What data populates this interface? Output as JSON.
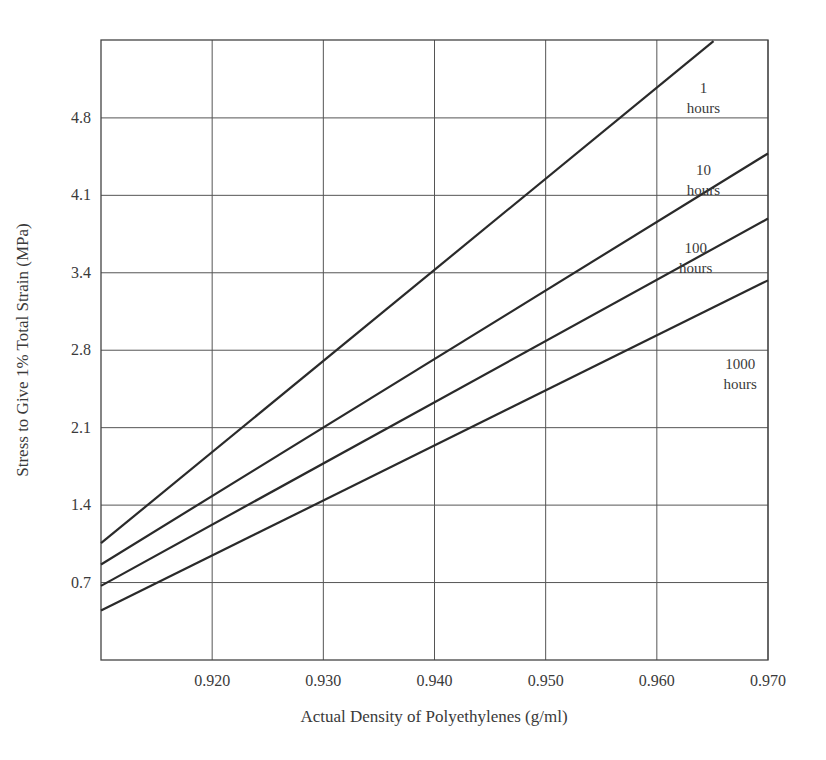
{
  "chart_data": {
    "type": "line",
    "title": "",
    "xlabel": "Actual Density of Polyethylenes (g/ml)",
    "ylabel": "Stress to Give 1% Total Strain (MPa)",
    "xlim": [
      0.91,
      0.97
    ],
    "ylim": [
      0,
      5.52
    ],
    "grid": true,
    "legend": "inline labels at right",
    "x_ticks": [
      {
        "value": 0.92,
        "label": "0.920"
      },
      {
        "value": 0.93,
        "label": "0.930"
      },
      {
        "value": 0.94,
        "label": "0.940"
      },
      {
        "value": 0.95,
        "label": "0.950"
      },
      {
        "value": 0.96,
        "label": "0.960"
      },
      {
        "value": 0.97,
        "label": "0.970"
      }
    ],
    "y_ticks": [
      {
        "value": 0.6895,
        "label": "0.7"
      },
      {
        "value": 1.379,
        "label": "1.4"
      },
      {
        "value": 2.0685,
        "label": "2.1"
      },
      {
        "value": 2.758,
        "label": "2.8"
      },
      {
        "value": 3.4475,
        "label": "3.4"
      },
      {
        "value": 4.137,
        "label": "4.1"
      },
      {
        "value": 4.8265,
        "label": "4.8"
      }
    ],
    "y_grid_extra": [
      5.516
    ],
    "series": [
      {
        "name": "1 hours",
        "label_lines": [
          "1",
          "hours"
        ],
        "label_pos": [
          0.9642,
          5.05
        ],
        "x": [
          0.91,
          0.9651
        ],
        "y": [
          1.04,
          5.51
        ]
      },
      {
        "name": "10 hours",
        "label_lines": [
          "10",
          "hours"
        ],
        "label_pos": [
          0.9642,
          4.32
        ],
        "x": [
          0.91,
          0.97
        ],
        "y": [
          0.85,
          4.51
        ]
      },
      {
        "name": "100 hours",
        "label_lines": [
          "100",
          "hours"
        ],
        "label_pos": [
          0.9635,
          3.62
        ],
        "x": [
          0.91,
          0.97
        ],
        "y": [
          0.66,
          3.93
        ]
      },
      {
        "name": "1000 hours",
        "label_lines": [
          "1000",
          "hours"
        ],
        "label_pos": [
          0.9675,
          2.59
        ],
        "x": [
          0.91,
          0.97
        ],
        "y": [
          0.44,
          3.38
        ]
      }
    ]
  }
}
